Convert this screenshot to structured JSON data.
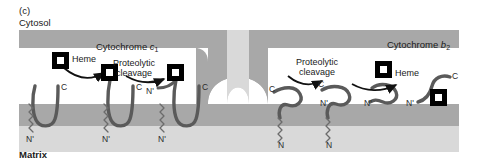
{
  "figure": {
    "panel_letter": "(c)",
    "compartments": {
      "top_label": "Cytosol",
      "bottom_label": "Matrix"
    },
    "colors": {
      "outer_membrane": "#a8a8a8",
      "inner_membrane": "#a8a8a8",
      "matrix_band": "#d9d9d9",
      "intermembrane_space": "#ffffff",
      "protein_chain": "#5a5a5a",
      "heme_fill": "#000000",
      "heme_center": "#ffffff",
      "arrow": "#111111",
      "text": "#1a1a1a"
    }
  },
  "labels": {
    "heme_left": "Heme",
    "heme_right": "Heme",
    "cytochrome_c1": {
      "prefix": "Cytochrome ",
      "italic": "c",
      "subscript": "1"
    },
    "cytochrome_b2": {
      "prefix": "Cytochrome ",
      "italic": "b",
      "subscript": "2"
    },
    "proteolytic_cleavage_left": {
      "line1": "Proteolytic",
      "line2": "cleavage"
    },
    "proteolytic_cleavage_right": {
      "line1": "Proteolytic",
      "line2": "cleavage"
    }
  },
  "termini": {
    "c1_stage1_C": "C",
    "c1_stage1_N": "N'",
    "c1_stage2_C": "C",
    "c1_stage2_N": "N'",
    "c1_stage2_Nprime_upper": "N'",
    "c1_stage3_C": "C",
    "c1_stage3_N": "N'",
    "b2_stage1_C": "C",
    "b2_stage1_N": "N",
    "b2_stage2_C": "C",
    "b2_stage2_N": "N",
    "b2_stage2_Nprime_upper": "N'",
    "b2_stage3_C": "C",
    "b2_stage3_N": "N'",
    "b2_stage4_N": "N'"
  }
}
